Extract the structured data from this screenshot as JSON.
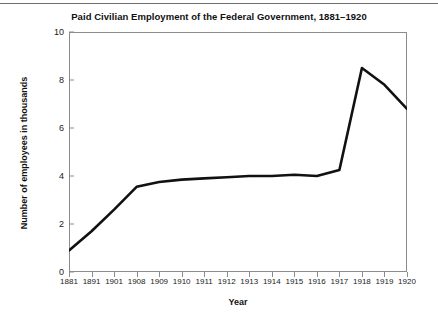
{
  "chart_data": {
    "type": "line",
    "title": "Paid Civilian Employment of the Federal Government, 1881–1920",
    "xlabel": "Year",
    "ylabel": "Number of employees in thousands",
    "grid": false,
    "legend": null,
    "xlim": [
      0,
      15
    ],
    "ylim": [
      0,
      10
    ],
    "yticks": [
      "0",
      "2",
      "4",
      "6",
      "8",
      "10"
    ],
    "ytick_values": [
      0,
      2,
      4,
      6,
      8,
      10
    ],
    "categories": [
      "1881",
      "1891",
      "1901",
      "1908",
      "1909",
      "1910",
      "1911",
      "1912",
      "1913",
      "1914",
      "1915",
      "1916",
      "1917",
      "1918",
      "1919",
      "1920"
    ],
    "values": [
      0.9,
      1.7,
      2.6,
      3.55,
      3.75,
      3.85,
      3.9,
      3.95,
      4.0,
      4.0,
      4.05,
      4.0,
      4.25,
      8.5,
      7.8,
      6.8
    ],
    "line_color": "#111111",
    "line_width": 2.6
  },
  "axes": {
    "frame_color": "#8c8c8c",
    "background": "#ffffff"
  }
}
